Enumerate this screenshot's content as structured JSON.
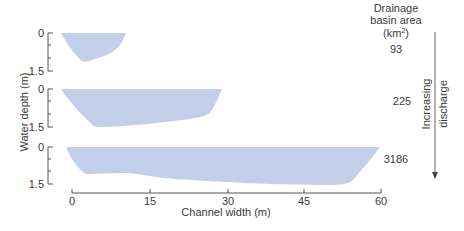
{
  "y_axis_label": "Water depth (m)",
  "x_axis_label": "Channel width (m)",
  "x_ticks": [
    "0",
    "15",
    "30",
    "45",
    "60"
  ],
  "depth_ticks": [
    "0",
    "1.5"
  ],
  "legend_header": {
    "line1": "Drainage",
    "line2": "basin area",
    "line3": "(km",
    "line3_sup": "2",
    "line3_end": ")"
  },
  "channels": [
    {
      "basin_area": "93"
    },
    {
      "basin_area": "225"
    },
    {
      "basin_area": "3186"
    }
  ],
  "arrow_label": {
    "line1": "Increasing",
    "line2": "discharge"
  },
  "colors": {
    "water": "#c3cfe9",
    "axis": "#555555"
  }
}
